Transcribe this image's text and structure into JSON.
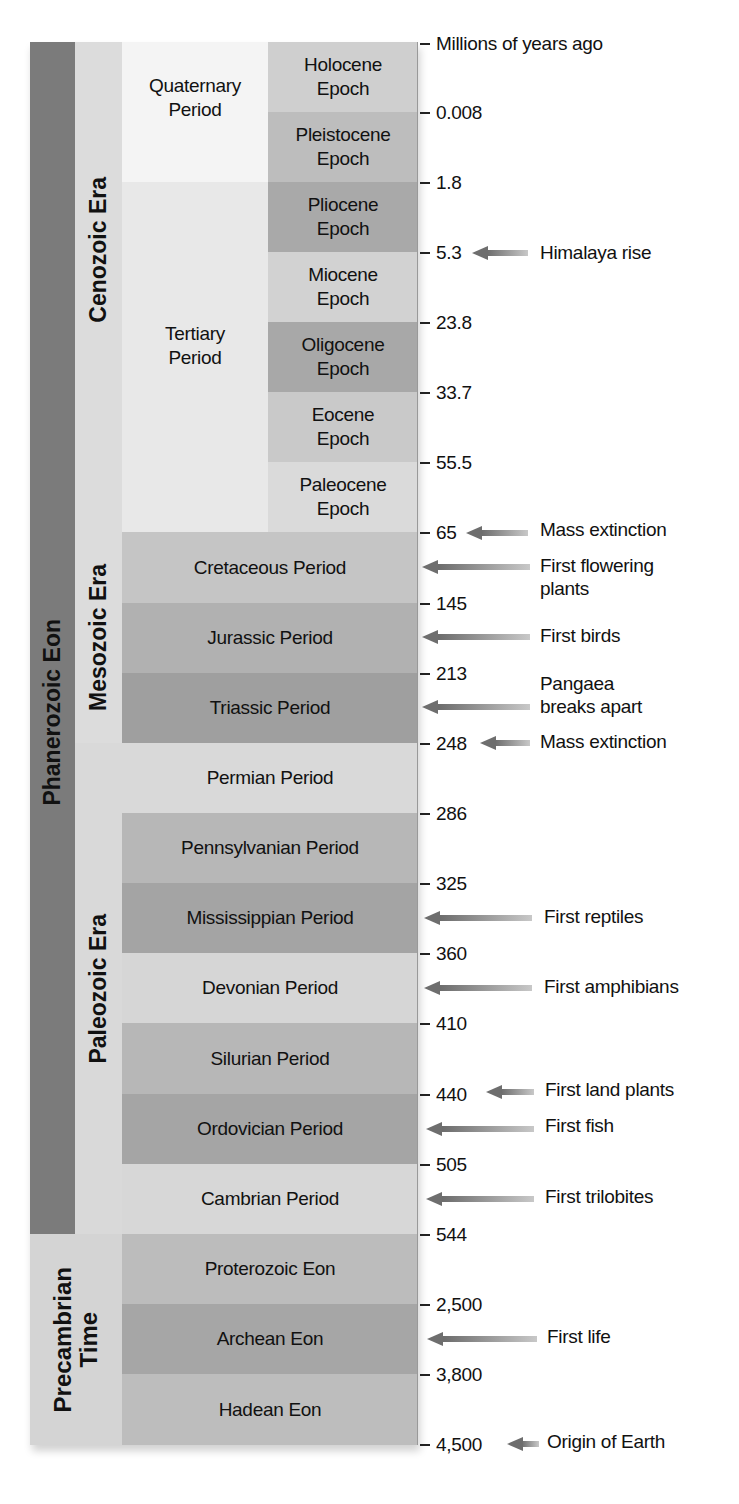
{
  "axis": {
    "title": "Millions of years ago",
    "ticks": [
      "0.008",
      "1.8",
      "5.3",
      "23.8",
      "33.7",
      "55.5",
      "65",
      "145",
      "213",
      "248",
      "286",
      "325",
      "360",
      "410",
      "440",
      "505",
      "544",
      "2,500",
      "3,800",
      "4,500"
    ]
  },
  "eons": {
    "phanerozoic": "Phanerozoic Eon",
    "precambrian_line1": "Precambrian",
    "precambrian_line2": "Time"
  },
  "eras": {
    "cenozoic": "Cenozoic Era",
    "mesozoic": "Mesozoic Era",
    "paleozoic": "Paleozoic Era"
  },
  "cenozoic_periods": [
    {
      "line1": "Quaternary",
      "line2": "Period"
    },
    {
      "line1": "Tertiary",
      "line2": "Period"
    }
  ],
  "epochs": [
    {
      "line1": "Holocene",
      "line2": "Epoch"
    },
    {
      "line1": "Pleistocene",
      "line2": "Epoch"
    },
    {
      "line1": "Pliocene",
      "line2": "Epoch"
    },
    {
      "line1": "Miocene",
      "line2": "Epoch"
    },
    {
      "line1": "Oligocene",
      "line2": "Epoch"
    },
    {
      "line1": "Eocene",
      "line2": "Epoch"
    },
    {
      "line1": "Paleocene",
      "line2": "Epoch"
    }
  ],
  "periods": [
    "Cretaceous Period",
    "Jurassic Period",
    "Triassic Period",
    "Permian Period",
    "Pennsylvanian Period",
    "Mississippian Period",
    "Devonian Period",
    "Silurian Period",
    "Ordovician Period",
    "Cambrian Period"
  ],
  "precambrian_eons": [
    "Proterozoic Eon",
    "Archean Eon",
    "Hadean Eon"
  ],
  "events": [
    {
      "label": "Himalaya rise",
      "at": "5.3"
    },
    {
      "label": "Mass extinction",
      "at": "65"
    },
    {
      "label_line1": "First flowering",
      "label_line2": "plants",
      "at": "Cretaceous"
    },
    {
      "label": "First birds",
      "at": "Jurassic"
    },
    {
      "label_line1": "Pangaea",
      "label_line2": "breaks apart",
      "at": "Triassic"
    },
    {
      "label": "Mass extinction",
      "at": "248"
    },
    {
      "label": "First reptiles",
      "at": "Mississippian"
    },
    {
      "label": "First amphibians",
      "at": "Devonian"
    },
    {
      "label": "First land plants",
      "at": "440"
    },
    {
      "label": "First fish",
      "at": "Ordovician"
    },
    {
      "label": "First trilobites",
      "at": "Cambrian"
    },
    {
      "label": "First life",
      "at": "Archean"
    },
    {
      "label": "Origin of Earth",
      "at": "4,500"
    }
  ],
  "colors": {
    "eon_bar": "#7a7a7a",
    "era_column": "#d9d9d9",
    "quaternary": "#f3f3f3",
    "tertiary": "#e6e6e6",
    "light_row": "#d8d8d8",
    "mid_row": "#b8b8b8",
    "dark_row": "#a3a3a3"
  }
}
